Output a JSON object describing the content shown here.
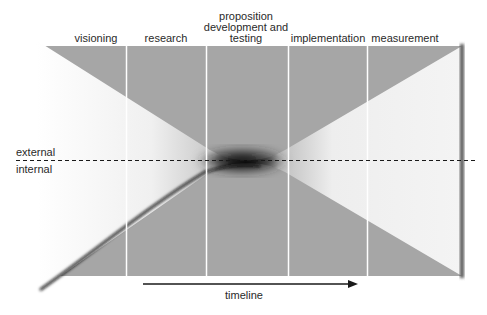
{
  "diagram": {
    "phases": [
      {
        "label": "visioning",
        "x": 96
      },
      {
        "label": "research",
        "x": 166
      },
      {
        "label": "proposition development and testing",
        "lines": [
          "proposition",
          "development and",
          "testing"
        ],
        "x": 246
      },
      {
        "label": "implementation",
        "x": 328
      },
      {
        "label": "measurement",
        "x": 405
      }
    ],
    "side_labels": {
      "external": "external",
      "internal": "internal"
    },
    "axis": {
      "label": "timeline",
      "direction": "left-to-right"
    },
    "colors": {
      "band": "#a6a6a6",
      "wedge": "#f2f2f2",
      "divider": "#ffffff",
      "ink": "#1a1a1a"
    }
  }
}
